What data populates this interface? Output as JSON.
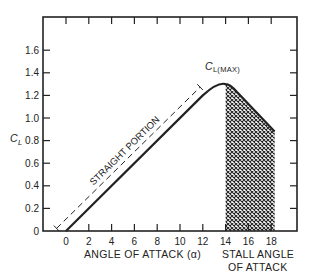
{
  "chart_data": {
    "type": "line",
    "title": "",
    "xlabel": "ANGLE OF ATTACK (α)",
    "ylabel": "C_L",
    "xlim": [
      -2,
      20.5
    ],
    "ylim": [
      0,
      1.8
    ],
    "x_ticks": [
      0,
      2,
      4,
      6,
      8,
      10,
      12,
      14,
      16,
      18
    ],
    "x_tick_labels": [
      "0",
      "2",
      "4",
      "6",
      "8",
      "10",
      "12",
      "14",
      "16",
      "18"
    ],
    "y_ticks": [
      0,
      0.2,
      0.4,
      0.6,
      0.8,
      1.0,
      1.2,
      1.4,
      1.6
    ],
    "y_tick_labels": [
      "0",
      "0.2",
      "0.4",
      "0.6",
      "0.8",
      "1.0",
      "1.2",
      "1.4",
      "1.6"
    ],
    "grid": false,
    "series": [
      {
        "name": "Lift coefficient",
        "x": [
          0,
          2,
          4,
          6,
          8,
          10,
          12,
          12.8,
          13.5,
          14,
          14.4,
          15,
          16,
          17,
          18,
          18.3
        ],
        "values": [
          0,
          0.2,
          0.4,
          0.6,
          0.8,
          1.0,
          1.2,
          1.26,
          1.295,
          1.3,
          1.295,
          1.23,
          1.12,
          1.01,
          0.91,
          0.88
        ]
      }
    ],
    "annotations": [
      {
        "text": "STRAIGHT PORTION",
        "x_range": [
          -0.6,
          12.2
        ],
        "note": "dimension line parallel to linear region"
      },
      {
        "text": "C_L(MAX)",
        "x": 14,
        "y": 1.3
      },
      {
        "text": "STALL ANGLE OF ATTACK",
        "x_range": [
          14,
          18.3
        ],
        "note": "cross-hatched region"
      }
    ]
  },
  "labels": {
    "y_axis_symbol": "C",
    "y_axis_subscript": "L",
    "x_axis_title": "ANGLE OF ATTACK (α)",
    "straight_portion": "STRAIGHT PORTION",
    "clmax_symbol": "C",
    "clmax_subscript": "L(MAX)",
    "stall_line1": "STALL ANGLE",
    "stall_line2": "OF ATTACK"
  },
  "colors": {
    "ink": "#222222",
    "background": "#ffffff"
  }
}
